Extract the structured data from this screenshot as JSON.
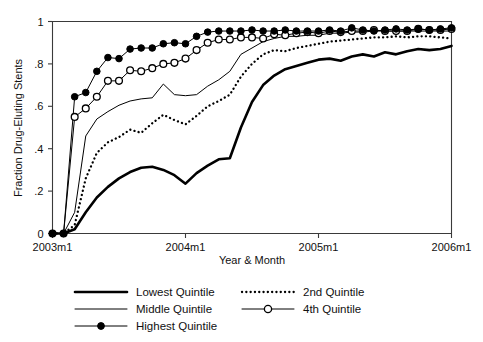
{
  "chart_data": {
    "type": "line",
    "title": "",
    "xlabel": "Year & Month",
    "ylabel": "Fraction Drug-Eluting Stents",
    "xlim": [
      0,
      36
    ],
    "ylim": [
      0,
      1
    ],
    "grid": false,
    "legend_position": "bottom",
    "xtick_labels": [
      "2003m1",
      "2004m1",
      "2005m1",
      "2006m1"
    ],
    "xtick_values": [
      0,
      12,
      24,
      36
    ],
    "ytick_labels": [
      "0",
      ".2",
      ".4",
      ".6",
      ".8",
      "1"
    ],
    "ytick_values": [
      0,
      0.2,
      0.4,
      0.6,
      0.8,
      1
    ],
    "x": [
      0,
      1,
      2,
      3,
      4,
      5,
      6,
      7,
      8,
      9,
      10,
      11,
      12,
      13,
      14,
      15,
      16,
      17,
      18,
      19,
      20,
      21,
      22,
      23,
      24,
      25,
      26,
      27,
      28,
      29,
      30,
      31,
      32,
      33,
      34,
      35,
      36
    ],
    "series": [
      {
        "name": "Lowest Quintile",
        "style": "thick-solid",
        "marker": "none",
        "color": "#000000",
        "values": [
          0,
          0,
          0.02,
          0.1,
          0.17,
          0.22,
          0.26,
          0.29,
          0.31,
          0.315,
          0.3,
          0.275,
          0.235,
          0.285,
          0.32,
          0.35,
          0.355,
          0.5,
          0.62,
          0.7,
          0.745,
          0.775,
          0.79,
          0.805,
          0.82,
          0.825,
          0.815,
          0.835,
          0.845,
          0.835,
          0.855,
          0.845,
          0.86,
          0.87,
          0.865,
          0.87,
          0.885
        ]
      },
      {
        "name": "2nd Quintile",
        "style": "dotted",
        "marker": "none",
        "color": "#000000",
        "values": [
          0,
          0,
          0.04,
          0.26,
          0.38,
          0.43,
          0.455,
          0.49,
          0.475,
          0.52,
          0.56,
          0.535,
          0.515,
          0.555,
          0.6,
          0.625,
          0.655,
          0.74,
          0.8,
          0.845,
          0.865,
          0.86,
          0.875,
          0.885,
          0.895,
          0.905,
          0.91,
          0.915,
          0.92,
          0.925,
          0.925,
          0.93,
          0.925,
          0.93,
          0.93,
          0.925,
          0.92
        ]
      },
      {
        "name": "Middle Quintile",
        "style": "thin-solid",
        "marker": "none",
        "color": "#000000",
        "values": [
          0,
          0,
          0.1,
          0.46,
          0.54,
          0.575,
          0.605,
          0.625,
          0.635,
          0.64,
          0.705,
          0.655,
          0.65,
          0.655,
          0.695,
          0.725,
          0.765,
          0.845,
          0.875,
          0.905,
          0.92,
          0.93,
          0.93,
          0.935,
          0.935,
          0.945,
          0.945,
          0.95,
          0.95,
          0.955,
          0.955,
          0.955,
          0.955,
          0.955,
          0.955,
          0.955,
          0.955
        ]
      },
      {
        "name": "4th Quintile",
        "style": "thin-solid",
        "marker": "open-circle",
        "color": "#000000",
        "values": [
          0,
          0,
          0.55,
          0.59,
          0.645,
          0.72,
          0.72,
          0.77,
          0.765,
          0.78,
          0.8,
          0.805,
          0.825,
          0.865,
          0.9,
          0.915,
          0.915,
          0.925,
          0.925,
          0.92,
          0.94,
          0.935,
          0.945,
          0.95,
          0.945,
          0.955,
          0.95,
          0.955,
          0.955,
          0.96,
          0.955,
          0.955,
          0.955,
          0.965,
          0.96,
          0.96,
          0.965
        ]
      },
      {
        "name": "Highest Quintile",
        "style": "thin-solid",
        "marker": "filled-circle",
        "color": "#000000",
        "values": [
          0,
          0,
          0.645,
          0.665,
          0.765,
          0.83,
          0.825,
          0.87,
          0.875,
          0.875,
          0.895,
          0.9,
          0.895,
          0.93,
          0.95,
          0.955,
          0.955,
          0.955,
          0.96,
          0.955,
          0.955,
          0.96,
          0.955,
          0.955,
          0.955,
          0.96,
          0.955,
          0.97,
          0.96,
          0.955,
          0.96,
          0.965,
          0.96,
          0.965,
          0.96,
          0.965,
          0.97
        ]
      }
    ]
  },
  "legend": {
    "items": [
      {
        "label": "Lowest Quintile",
        "style": "thick-solid",
        "marker": "none"
      },
      {
        "label": "2nd Quintile",
        "style": "dotted",
        "marker": "none"
      },
      {
        "label": "Middle Quintile",
        "style": "thin-solid",
        "marker": "none"
      },
      {
        "label": "4th Quintile",
        "style": "thin-solid",
        "marker": "open-circle"
      },
      {
        "label": "Highest Quintile",
        "style": "thin-solid",
        "marker": "filled-circle"
      }
    ]
  }
}
